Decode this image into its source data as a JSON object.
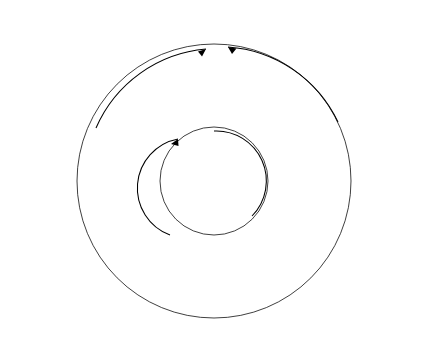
{
  "figure": {
    "type": "radial-ring-diagram",
    "title": "",
    "center": {
      "x": 214,
      "y": 181
    }
  },
  "rings": {
    "order_outer_to_inner": [
      "W",
      "F",
      "M",
      "E",
      "A"
    ],
    "cycle_letters": [
      "W",
      "F",
      "M",
      "E",
      "A"
    ],
    "colors": {
      "W": "#7a7a7a",
      "F": "#5e5e5e",
      "M": "#c9c9c9",
      "E": "#6d6d6d",
      "A": "#4f4f4f",
      "gap": "#ffffff",
      "outline": "#000000"
    }
  },
  "inner_arc_labels": [
    {
      "text": "Source"
    },
    {
      "text": "Resource"
    },
    {
      "text": "Process"
    },
    {
      "text": "Use"
    }
  ],
  "legend": {
    "entries": [
      {
        "symbol": "W",
        "dash": "—",
        "label": "Water cycle"
      },
      {
        "symbol": "F",
        "dash": "—",
        "label": "Food cycle"
      },
      {
        "symbol": "M",
        "dash": "—",
        "label": "Material cycle"
      },
      {
        "symbol": "E",
        "dash": "—",
        "label": "Energy cycle"
      },
      {
        "symbol": "A",
        "dash": "—",
        "label": "Air cycle"
      }
    ]
  },
  "labels_top_left": [
    "Buruli ulcer*",
    "Cholera",
    "Cryptosporidiosis",
    "Ecoli",
    "Hepatitis",
    "Leishmaniasis",
    "Meningitis",
    "Rotavirus",
    "Salmonella",
    "Schistosomiasis",
    "Shigellosis",
    "Sleeping sickness"
  ],
  "labels_bottom_left": [
    "Asthma",
    "Buruli ulcer*",
    "Dracunculiasis*",
    "Cancer",
    "COPD",
    "Cystic fibrosis",
    "Diabetes",
    "Heart disease",
    "Influenza",
    "Leprosy*",
    "Measles",
    "Obesity",
    "Pneumonia",
    "Strep throat",
    "Tuberculosis*",
    "Typhoid"
  ],
  "labels_top_right": [
    "Asthma",
    "Child underweight*",
    "Denge",
    "Japanese encephalitis",
    "Lymphatic filariasis*",
    "Malaria*",
    "Maternal health*",
    "Onchocerciasis",
    "West Nile virus"
  ],
  "labels_bottom_right": [
    "Asthma",
    "Cancer"
  ]
}
